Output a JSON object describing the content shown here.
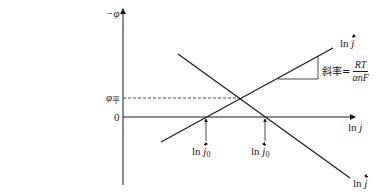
{
  "diagram": {
    "type": "tafel-plot",
    "y_axis": {
      "label": "−φ",
      "origin_label": "0"
    },
    "x_axis": {
      "label": "ln j"
    },
    "reference_level": {
      "label": "φ平",
      "symbol": "φ",
      "subscript": "平",
      "style": "dashed"
    },
    "lines": [
      {
        "name": "rising",
        "label": "ln j",
        "arrow_direction": "right",
        "from": [
          161,
          142
        ],
        "to": [
          333,
          48
        ]
      },
      {
        "name": "falling",
        "label": "ln j",
        "arrow_direction": "left",
        "from": [
          178,
          54
        ],
        "to": [
          350,
          178
        ]
      }
    ],
    "slope_annotation": {
      "prefix": "斜率=",
      "numerator": "RT",
      "denominator": "αnF"
    },
    "exchange_markers": [
      {
        "label": "ln j",
        "subscript": "0",
        "arrow_direction": "right",
        "x": 206
      },
      {
        "label": "ln j",
        "subscript": "0",
        "arrow_direction": "left",
        "x": 265
      }
    ],
    "colors": {
      "line": "#1a1a1a",
      "background": "#ffffff"
    }
  }
}
